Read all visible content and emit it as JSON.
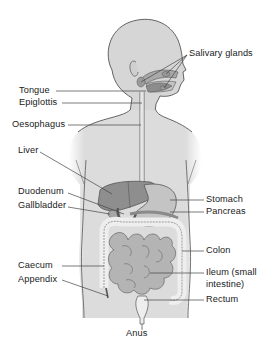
{
  "diagram": {
    "colors": {
      "skin": "#d9d9d9",
      "outline": "#555555",
      "organ_dark": "#8c8c8c",
      "organ_mid": "#b3b3b3",
      "organ_light": "#ececec",
      "leader_line": "#444444",
      "text": "#1a1a1a"
    },
    "labels": {
      "salivary_glands": "Salivary glands",
      "tongue": "Tongue",
      "epiglottis": "Epiglottis",
      "oesophagus": "Oesophagus",
      "liver": "Liver",
      "duodenum": "Duodenum",
      "gallbladder": "Gallbladder",
      "stomach": "Stomach",
      "pancreas": "Pancreas",
      "colon": "Colon",
      "caecum": "Caecum",
      "appendix": "Appendix",
      "ileum_line1": "Ileum (small",
      "ileum_line2": "intestine)",
      "rectum": "Rectum",
      "anus": "Anus"
    }
  }
}
